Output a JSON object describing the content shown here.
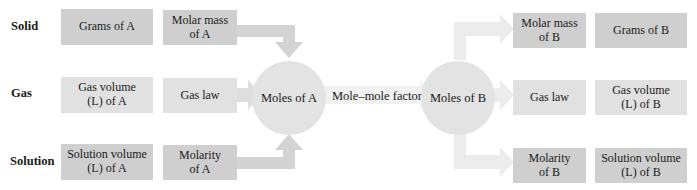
{
  "rows": {
    "solid": {
      "label": "Solid",
      "left_quantity": "Grams of A",
      "left_converter": "Molar mass of A",
      "right_converter": "Molar mass of B",
      "right_quantity": "Grams of B"
    },
    "gas": {
      "label": "Gas",
      "left_quantity": "Gas volume (L) of A",
      "left_converter": "Gas law",
      "right_converter": "Gas law",
      "right_quantity": "Gas volume (L) of B"
    },
    "solution": {
      "label": "Solution",
      "left_quantity": "Solution volume (L) of A",
      "left_converter": "Molarity of A",
      "right_converter": "Molarity of B",
      "right_quantity": "Solution volume (L) of B"
    }
  },
  "center": {
    "moles_a": "Moles of A",
    "factor": "Mole–mole factor",
    "moles_b": "Moles of B"
  },
  "colors": {
    "box_dark": "#cfcfcf",
    "box_light": "#e1e1e1",
    "arrow_left": "#d3d3d3",
    "arrow_right": "#ececec",
    "circle": "#e3e3e3"
  }
}
